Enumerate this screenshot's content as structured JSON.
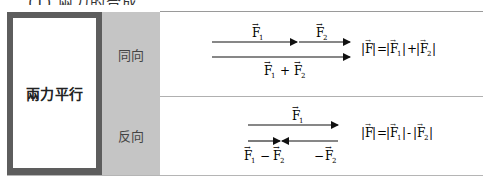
{
  "section_title": "(1) 兩力的合成",
  "table": {
    "row_header": "兩力平行",
    "rows": [
      {
        "label": "同向",
        "diagram": {
          "vector_1_label": "F1",
          "vector_2_label": "F2",
          "resultant_label": "F1 + F2"
        },
        "formula": "|F| = |F1| + |F2|"
      },
      {
        "label": "反向",
        "diagram": {
          "vector_1_label": "F1",
          "vector_2_label": "-F2",
          "resultant_label": "F1 - F2"
        },
        "formula": "|F| = |F1| - |F2|"
      }
    ]
  },
  "colors": {
    "frame": "#5d5d5d",
    "label_column": "#c5c5c5",
    "divider": "#9a9a9a",
    "arrow": "#111111"
  }
}
